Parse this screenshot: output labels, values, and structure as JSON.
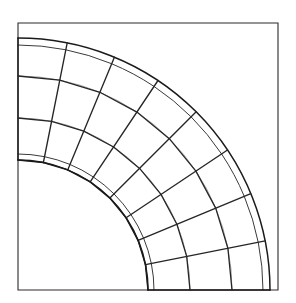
{
  "page": {
    "width": 296,
    "height": 303,
    "background": "#ffffff"
  },
  "header": {
    "left_caption": "",
    "right_caption": "",
    "note": "two short captions are clipped by the top edge of the screenshot and are illegible"
  },
  "figure": {
    "title": "",
    "kind": "quarter-annulus-mesh",
    "frame": {
      "stroke": "#2b2b2b",
      "x": 18,
      "y": 23,
      "width": 260,
      "height": 267
    },
    "colors": {
      "boundary_stroke": "#1a1a1a",
      "element_stroke": "#262626",
      "faint_stroke": "#8e8e94",
      "frame_stroke": "#2b2b2b",
      "background": "#ffffff"
    },
    "geometry": {
      "center_x": 18,
      "center_y": 290,
      "inner_radius": 130,
      "outer_radius": 252,
      "start_angle_deg": 0,
      "end_angle_deg": 90,
      "radial_divisions": 3,
      "angular_divisions": 8,
      "ring_radii": [
        130,
        172,
        214,
        252
      ]
    }
  },
  "chart_data": {
    "type": "table",
    "xlabel": "",
    "ylabel": "",
    "columns": [
      "ring",
      "inner_radius",
      "outer_radius",
      "sectors"
    ],
    "rows": [
      [
        "ring-1",
        130,
        172,
        8
      ],
      [
        "ring-2",
        172,
        214,
        8
      ],
      [
        "ring-3",
        214,
        252,
        8
      ]
    ],
    "annotations": [],
    "legend": []
  }
}
